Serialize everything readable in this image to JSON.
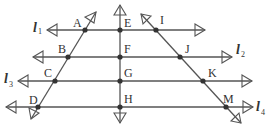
{
  "diagram": {
    "type": "geometry-parallel-lines",
    "lines": [
      {
        "name": "l",
        "subscript": "1",
        "y": 30
      },
      {
        "name": "l",
        "subscript": "2",
        "y": 57
      },
      {
        "name": "l",
        "subscript": "3",
        "y": 81
      },
      {
        "name": "l",
        "subscript": "4",
        "y": 107
      }
    ],
    "points": {
      "A": "A",
      "B": "B",
      "C": "C",
      "D": "D",
      "E": "E",
      "F": "F",
      "G": "G",
      "H": "H",
      "I": "I",
      "J": "J",
      "K": "K",
      "M": "M"
    },
    "transversals": [
      {
        "name": "left",
        "through": [
          "A",
          "B",
          "C",
          "D"
        ]
      },
      {
        "name": "middle",
        "through": [
          "E",
          "F",
          "G",
          "H"
        ]
      },
      {
        "name": "right",
        "through": [
          "I",
          "J",
          "K",
          "M"
        ]
      }
    ],
    "colors": {
      "stroke": "#555555",
      "point": "#333333"
    }
  }
}
